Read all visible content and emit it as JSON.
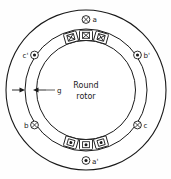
{
  "figure": {
    "kind": "round-rotor-synchronous-machine-cross-section",
    "center_text_line1": "Round",
    "center_text_line2": "rotor",
    "gap_label": "g",
    "stroke_color": "#1a1a1a",
    "fill_color": "#ffffff",
    "background": "#fefefe"
  },
  "terminals": [
    {
      "id": "a",
      "label": "a",
      "marker": "cross-circle",
      "marker_meaning": "current-into-page",
      "angle_deg": 270,
      "text_side": "right"
    },
    {
      "id": "bp",
      "label": "b'",
      "marker": "dot-circle",
      "marker_meaning": "current-out-of-page",
      "angle_deg": 330,
      "text_side": "right"
    },
    {
      "id": "c",
      "label": "c",
      "marker": "cross-circle",
      "marker_meaning": "current-into-page",
      "angle_deg": 30,
      "text_side": "right"
    },
    {
      "id": "ap",
      "label": "a'",
      "marker": "dot-circle",
      "marker_meaning": "current-out-of-page",
      "angle_deg": 90,
      "text_side": "right"
    },
    {
      "id": "b",
      "label": "b",
      "marker": "cross-circle",
      "marker_meaning": "current-into-page",
      "angle_deg": 150,
      "text_side": "left"
    },
    {
      "id": "cp",
      "label": "c'",
      "marker": "dot-circle",
      "marker_meaning": "current-out-of-page",
      "angle_deg": 210,
      "text_side": "left"
    }
  ],
  "slots": {
    "top_group_marker": "cross",
    "top_group_meaning": "current-into-page",
    "top_count": 3,
    "bottom_group_marker": "dot",
    "bottom_group_meaning": "current-out-of-page",
    "bottom_count": 3
  },
  "circles": {
    "stator_outer_radius": 81,
    "stator_bore_radius": 62,
    "rotor_radius": 50,
    "center_x": 86,
    "center_y": 90
  }
}
